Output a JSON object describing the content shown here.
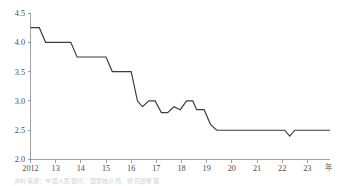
{
  "chart_data": {
    "type": "line",
    "title": "",
    "subtitle": "",
    "xlabel": "年",
    "ylabel": "",
    "xlim": [
      2012.0,
      2023.9
    ],
    "ylim": [
      2.0,
      4.5
    ],
    "grid": false,
    "legend": null,
    "line_color": "#3c3c3c",
    "axis_color": "#8a8a8a",
    "y_ticks": [
      "2.0",
      "2.5",
      "3.0",
      "3.5",
      "4.0",
      "4.5"
    ],
    "y_tick_values": [
      2.0,
      2.5,
      3.0,
      3.5,
      4.0,
      4.5
    ],
    "x_ticks": [
      "2012",
      "13",
      "14",
      "15",
      "16",
      "17",
      "18",
      "19",
      "20",
      "21",
      "22",
      "23"
    ],
    "x_tick_values": [
      2012,
      2013,
      2014,
      2015,
      2016,
      2017,
      2018,
      2019,
      2020,
      2021,
      2022,
      2023
    ],
    "x_unit_label": "年",
    "series": [
      {
        "name": "利率",
        "x": [
          2012.0,
          2012.35,
          2012.6,
          2013.6,
          2013.85,
          2015.0,
          2015.25,
          2016.0,
          2016.25,
          2016.45,
          2016.7,
          2016.95,
          2017.2,
          2017.45,
          2017.7,
          2017.95,
          2018.2,
          2018.45,
          2018.6,
          2018.9,
          2019.15,
          2019.4,
          2019.6,
          2022.1,
          2022.3,
          2022.5,
          2023.9
        ],
        "y": [
          4.25,
          4.25,
          4.0,
          4.0,
          3.75,
          3.75,
          3.5,
          3.5,
          3.0,
          2.9,
          3.0,
          3.0,
          2.8,
          2.8,
          2.9,
          2.85,
          3.0,
          3.0,
          2.85,
          2.85,
          2.6,
          2.5,
          2.5,
          2.5,
          2.4,
          2.5,
          2.5
        ]
      }
    ],
    "annotations": []
  },
  "caption": {
    "text": "资料来源：中国人民银行、国家统计局、研究部整理"
  }
}
